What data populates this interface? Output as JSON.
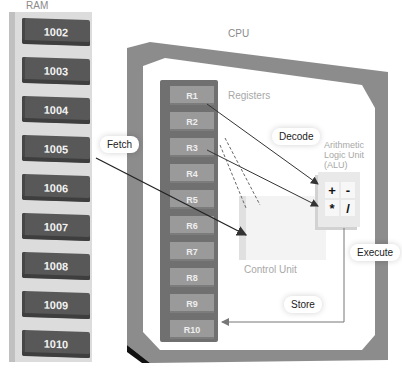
{
  "ram": {
    "title": "RAM",
    "cells": [
      "1002",
      "1003",
      "1004",
      "1005",
      "1006",
      "1007",
      "1008",
      "1009",
      "1010"
    ]
  },
  "cpu": {
    "title": "CPU",
    "registers_label": "Registers",
    "registers": [
      "R1",
      "R2",
      "R3",
      "R4",
      "R5",
      "R6",
      "R7",
      "R8",
      "R9",
      "R10"
    ],
    "alu_label_lines": [
      "Arithmetic",
      "Logic Unit",
      "(ALU)"
    ],
    "alu_ops": [
      "+",
      "-",
      "*",
      "/"
    ],
    "control_unit_label": "Control Unit"
  },
  "steps": {
    "fetch": "Fetch",
    "decode": "Decode",
    "execute": "Execute",
    "store": "Store"
  },
  "colors": {
    "ram_cell": "#585858",
    "cpu_frame": "#8c8c8c",
    "register_column": "#707070",
    "register": "#9a9a9a",
    "arrow": "#333333",
    "faint_label": "#a8a8a8"
  }
}
